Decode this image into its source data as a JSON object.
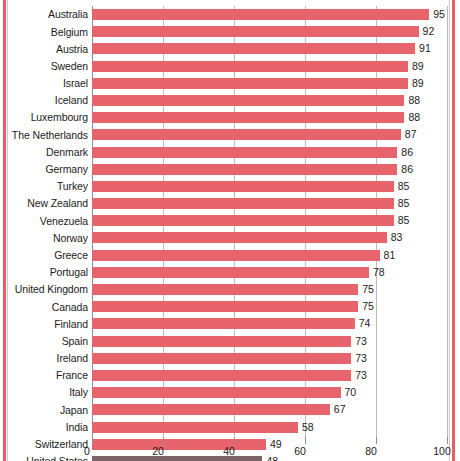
{
  "chart_data": {
    "type": "bar",
    "orientation": "horizontal",
    "title": "",
    "subtitle": "",
    "xlabel": "",
    "ylabel": "",
    "xlim": [
      0,
      100
    ],
    "xticks": [
      0,
      20,
      40,
      60,
      80,
      100
    ],
    "xtick_labels": [
      "0",
      "20",
      "40",
      "60",
      "80",
      "100"
    ],
    "grid": true,
    "grid_axis": "x",
    "legend": "none",
    "bar_color": "#e8646c",
    "highlight_color": "#7a6468",
    "highlight_category": "United States",
    "categories": [
      "Australia",
      "Belgium",
      "Austria",
      "Sweden",
      "Israel",
      "Iceland",
      "Luxembourg",
      "The Netherlands",
      "Denmark",
      "Germany",
      "Turkey",
      "New Zealand",
      "Venezuela",
      "Norway",
      "Greece",
      "Portugal",
      "United Kingdom",
      "Canada",
      "Finland",
      "Spain",
      "Ireland",
      "France",
      "Italy",
      "Japan",
      "India",
      "Switzerland",
      "United States"
    ],
    "values": [
      95,
      92,
      91,
      89,
      89,
      88,
      88,
      87,
      86,
      86,
      85,
      85,
      85,
      83,
      81,
      78,
      75,
      75,
      74,
      73,
      73,
      73,
      70,
      67,
      58,
      49,
      48
    ],
    "value_labels": [
      "95",
      "92",
      "91",
      "89",
      "89",
      "88",
      "88",
      "87",
      "86",
      "86",
      "85",
      "85",
      "85",
      "83",
      "81",
      "78",
      "75",
      "75",
      "74",
      "73",
      "73",
      "73",
      "70",
      "67",
      "58",
      "49",
      "48"
    ]
  }
}
